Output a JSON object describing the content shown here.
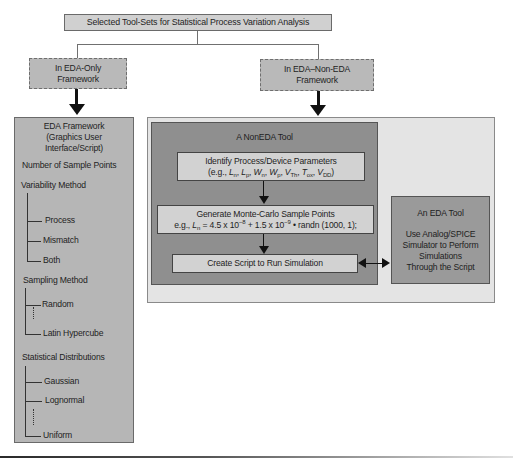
{
  "title": "Selected Tool-Sets for Statistical Process Variation Analysis",
  "branches": {
    "left": {
      "label_line1": "In EDA-Only",
      "label_line2": "Framework"
    },
    "right": {
      "label_line1": "In EDA–Non-EDA",
      "label_line2": "Framework"
    }
  },
  "eda_framework": {
    "heading_line1": "EDA Framework",
    "heading_line2": "(Graphics User",
    "heading_line3": "Interface/Script)",
    "sample_points": "Number of Sample Points",
    "variability": {
      "label": "Variability Method",
      "items": [
        "Process",
        "Mismatch",
        "Both"
      ]
    },
    "sampling": {
      "label": "Sampling Method",
      "items": [
        "Random",
        "Latin Hypercube"
      ]
    },
    "distributions": {
      "label": "Statistical Distributions",
      "items": [
        "Gaussian",
        "Lognormal",
        "Uniform"
      ]
    }
  },
  "non_eda_tool": {
    "title": "A NonEDA Tool",
    "identify": {
      "line1": "Identify Process/Device Parameters",
      "params_prefix": "(e.g., ",
      "params": [
        {
          "sym": "L",
          "sub": "n"
        },
        {
          "sym": "L",
          "sub": "p"
        },
        {
          "sym": "W",
          "sub": "n"
        },
        {
          "sym": "W",
          "sub": "p"
        },
        {
          "sym": "V",
          "sub": "Th"
        },
        {
          "sym": "T",
          "sub": "ox"
        },
        {
          "sym": "V",
          "sub": "DD"
        }
      ],
      "params_suffix": ")"
    },
    "generate": {
      "line1": "Generate Monte-Carlo Sample Points",
      "eg": "e.g., ",
      "var": "L",
      "var_sub": "n",
      "eq_part1": " = 4.5 x 10",
      "exp1": "−8",
      "eq_part2": " + 1.5 x 10",
      "exp2": "−9",
      "eq_part3": " • randn (1000, 1);"
    },
    "script": "Create Script to Run Simulation"
  },
  "eda_tool": {
    "title": "An EDA Tool",
    "line1": "Use Analog/SPICE",
    "line2": "Simulator to Perform",
    "line3": "Simulations",
    "line4": "Through the Script"
  },
  "colors": {
    "light_box": "#d2d2d2",
    "mid_box": "#b4b4b4",
    "dark_box": "#8d8d8d",
    "outer_light": "#e6e6e6",
    "arrow": "#111111"
  }
}
